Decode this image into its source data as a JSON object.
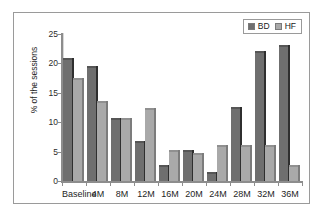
{
  "chart_data": {
    "type": "bar",
    "title": "",
    "xlabel": "",
    "ylabel": "% of the sessions",
    "ylim": [
      0,
      25
    ],
    "yticks": [
      0,
      5,
      10,
      15,
      20,
      25
    ],
    "ytick_labels": [
      "0",
      "5",
      "10",
      "15",
      "20",
      "25"
    ],
    "grid": false,
    "legend_position": "top-right",
    "categories": [
      "Baseline",
      "4M",
      "8M",
      "12M",
      "16M",
      "20M",
      "24M",
      "28M",
      "32M",
      "36M"
    ],
    "series": [
      {
        "name": "BD",
        "color": "#6f6f6f",
        "values": [
          20.6,
          19.2,
          10.4,
          6.4,
          2.4,
          4.9,
          1.2,
          12.3,
          21.7,
          22.8
        ]
      },
      {
        "name": "HF",
        "color": "#a9a9a9",
        "values": [
          17.2,
          13.2,
          10.4,
          12.1,
          5.0,
          4.4,
          5.7,
          5.8,
          5.8,
          2.3
        ]
      }
    ]
  }
}
